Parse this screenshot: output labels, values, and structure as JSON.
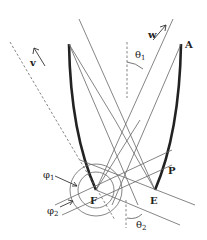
{
  "diagram": {
    "title": "",
    "labels": {
      "A": "A",
      "P": "P",
      "E": "E",
      "F": "F",
      "w": "w",
      "v": "v",
      "theta1": "θ",
      "theta1_sub": "1",
      "theta2": "θ",
      "theta2_sub": "2",
      "phi1": "φ",
      "phi1_sub": "1",
      "phi2": "φ",
      "phi2_sub": "2"
    },
    "colors": {
      "line": "#555555",
      "curve": "#222222",
      "dashed": "#666666"
    }
  }
}
